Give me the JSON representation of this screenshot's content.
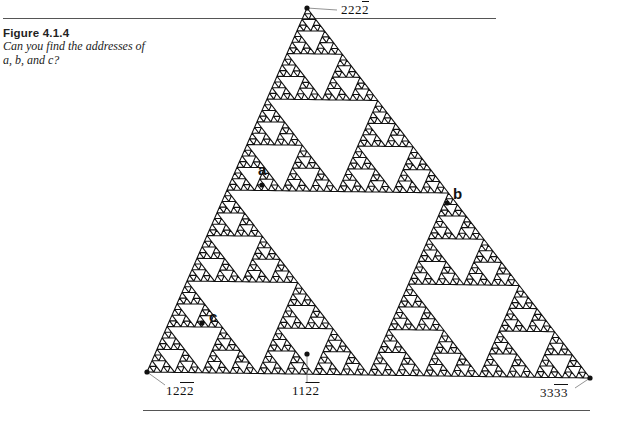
{
  "caption": {
    "figure_label": "Figure 4.1.4",
    "text": "Can you find the addresses of a, b, and c?"
  },
  "figure": {
    "type": "sierpinski-triangle",
    "vertices": {
      "top": [
        307,
        8
      ],
      "bottom_left": [
        147,
        372
      ],
      "bottom_right": [
        590,
        378
      ]
    },
    "depth": 6,
    "color": "#111111",
    "corner_addresses": [
      {
        "id": "top",
        "prefix": "222",
        "overlined": "2",
        "text": "2222",
        "x": 341,
        "y": 2,
        "leader": [
          307,
          8,
          337,
          10
        ]
      },
      {
        "id": "bottom-left",
        "prefix": "12",
        "overlined": "22",
        "text": "1222",
        "x": 166,
        "y": 383,
        "leader": [
          147,
          372,
          165,
          385
        ]
      },
      {
        "id": "middle",
        "prefix": "11",
        "overlined": "22",
        "text": "1122",
        "x": 292,
        "y": 383,
        "leader": [
          307,
          354,
          307,
          383
        ]
      },
      {
        "id": "bottom-right",
        "prefix": "33",
        "overlined": "33",
        "text": "3333",
        "x": 540,
        "y": 385,
        "leader": [
          590,
          378,
          575,
          388
        ]
      }
    ],
    "points": [
      {
        "label": "a",
        "x": 258,
        "y": 161,
        "dot": [
          262,
          185
        ]
      },
      {
        "label": "b",
        "x": 453,
        "y": 185,
        "dot": [
          447,
          203
        ]
      },
      {
        "label": "c",
        "x": 209,
        "y": 308,
        "dot": [
          202,
          323
        ]
      }
    ]
  }
}
